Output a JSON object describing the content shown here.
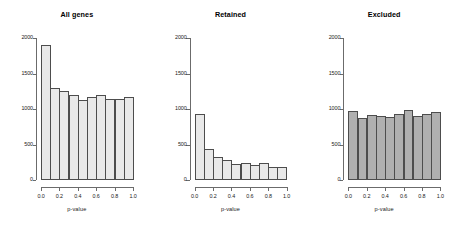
{
  "figure": {
    "background": "#ffffff",
    "axis_color": "#6b6b6b",
    "text_color": "#1a1a1a"
  },
  "chart_data": [
    {
      "type": "bar",
      "title": "All genes",
      "xlabel": "p-value",
      "ylabel": "",
      "xlim": [
        0.0,
        1.0
      ],
      "ylim": [
        0,
        2000
      ],
      "grid": false,
      "legend": null,
      "bar_fill": "#e9e9e9",
      "bar_edge": "#4d4d4d",
      "xticks": [
        "0.0",
        "0.2",
        "0.4",
        "0.6",
        "0.8",
        "1.0"
      ],
      "xtick_values": [
        0.0,
        0.2,
        0.4,
        0.6,
        0.8,
        1.0
      ],
      "yticks": [
        "0",
        "500",
        "1000",
        "1500",
        "2000"
      ],
      "ytick_values": [
        0,
        500,
        1000,
        1500,
        2000
      ],
      "categories": [
        "0.0-0.1",
        "0.1-0.2",
        "0.2-0.3",
        "0.3-0.4",
        "0.4-0.5",
        "0.5-0.6",
        "0.6-0.7",
        "0.7-0.8",
        "0.8-0.9",
        "0.9-1.0"
      ],
      "values": [
        1900,
        1300,
        1250,
        1200,
        1130,
        1170,
        1200,
        1140,
        1135,
        1165
      ]
    },
    {
      "type": "bar",
      "title": "Retained",
      "xlabel": "p-value",
      "ylabel": "",
      "xlim": [
        0.0,
        1.0
      ],
      "ylim": [
        0,
        2000
      ],
      "grid": false,
      "legend": null,
      "bar_fill": "#e9e9e9",
      "bar_edge": "#4d4d4d",
      "xticks": [
        "0.0",
        "0.2",
        "0.4",
        "0.6",
        "0.8",
        "1.0"
      ],
      "xtick_values": [
        0.0,
        0.2,
        0.4,
        0.6,
        0.8,
        1.0
      ],
      "yticks": [
        "0",
        "500",
        "1000",
        "1500",
        "2000"
      ],
      "ytick_values": [
        0,
        500,
        1000,
        1500,
        2000
      ],
      "categories": [
        "0.0-0.1",
        "0.1-0.2",
        "0.2-0.3",
        "0.3-0.4",
        "0.4-0.5",
        "0.5-0.6",
        "0.6-0.7",
        "0.7-0.8",
        "0.8-0.9",
        "0.9-1.0"
      ],
      "values": [
        930,
        430,
        330,
        280,
        220,
        235,
        205,
        235,
        185,
        180
      ]
    },
    {
      "type": "bar",
      "title": "Excluded",
      "xlabel": "p-value",
      "ylabel": "",
      "xlim": [
        0.0,
        1.0
      ],
      "ylim": [
        0,
        2000
      ],
      "grid": false,
      "legend": null,
      "bar_fill": "#b0b0b0",
      "bar_edge": "#4d4d4d",
      "xticks": [
        "0.0",
        "0.2",
        "0.4",
        "0.6",
        "0.8",
        "1.0"
      ],
      "xtick_values": [
        0.0,
        0.2,
        0.4,
        0.6,
        0.8,
        1.0
      ],
      "yticks": [
        "0",
        "500",
        "1000",
        "1500",
        "2000"
      ],
      "ytick_values": [
        0,
        500,
        1000,
        1500,
        2000
      ],
      "categories": [
        "0.0-0.1",
        "0.1-0.2",
        "0.2-0.3",
        "0.3-0.4",
        "0.4-0.5",
        "0.5-0.6",
        "0.6-0.7",
        "0.7-0.8",
        "0.8-0.9",
        "0.9-1.0"
      ],
      "values": [
        970,
        870,
        910,
        895,
        890,
        935,
        990,
        900,
        935,
        965
      ]
    }
  ]
}
